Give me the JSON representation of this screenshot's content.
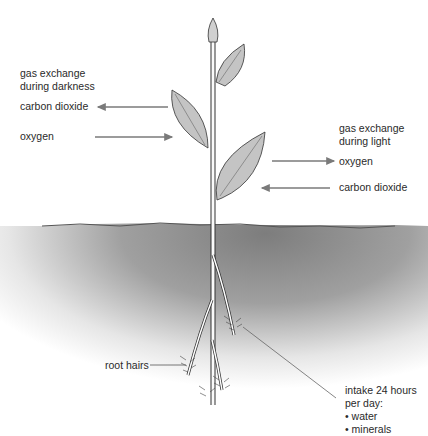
{
  "diagram": {
    "darkness": {
      "heading_line1": "gas exchange",
      "heading_line2": "during darkness",
      "out_gas": "carbon dioxide",
      "in_gas": "oxygen"
    },
    "light": {
      "heading_line1": "gas exchange",
      "heading_line2": "during light",
      "out_gas": "oxygen",
      "in_gas": "carbon dioxide"
    },
    "roots": {
      "label": "root hairs"
    },
    "intake": {
      "line1": "intake 24 hours",
      "line2": "per day:",
      "items": [
        "• water",
        "• minerals"
      ]
    },
    "colors": {
      "soil": "#8a8a8a",
      "leaf_fill": "#c4c4c4",
      "arrow": "#7a7a7a",
      "outline": "#3a3a3a"
    }
  }
}
